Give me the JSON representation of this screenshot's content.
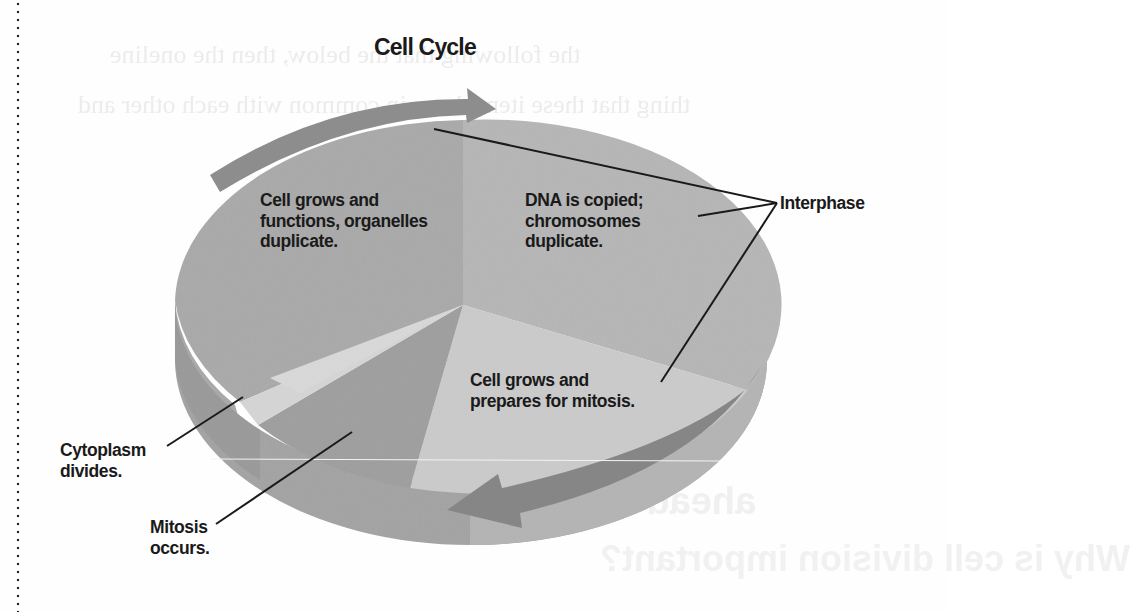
{
  "diagram": {
    "title": "Cell Cycle",
    "phases": [
      {
        "id": "g1",
        "text": "Cell grows and\nfunctions, organelles\nduplicate.",
        "group": "Interphase",
        "shade": "#a9a9a9"
      },
      {
        "id": "s",
        "text": "DNA is copied;\nchromosomes\nduplicate.",
        "group": "Interphase",
        "shade": "#b6b6b6"
      },
      {
        "id": "g2",
        "text": "Cell grows and\nprepares for mitosis.",
        "group": "Interphase",
        "shade": "#cbcbcb"
      },
      {
        "id": "mitosis",
        "text": "Mitosis\noccurs.",
        "group": "M phase",
        "shade": "#9d9d9d"
      },
      {
        "id": "cytokinesis",
        "text": "Cytoplasm\ndivides.",
        "group": "M phase",
        "shade": "#d6d6d6"
      }
    ],
    "callouts": {
      "interphase": "Interphase",
      "cytokinesis": "Cytoplasm\ndivides.",
      "mitosis": "Mitosis\noccurs."
    },
    "labels": {
      "g1": "Cell grows and\nfunctions, organelles\nduplicate.",
      "s": "DNA is copied;\nchromosomes\nduplicate.",
      "g2": "Cell grows and\nprepares for mitosis."
    },
    "arrows": {
      "direction": "clockwise",
      "color": "#8a8a8a"
    }
  }
}
